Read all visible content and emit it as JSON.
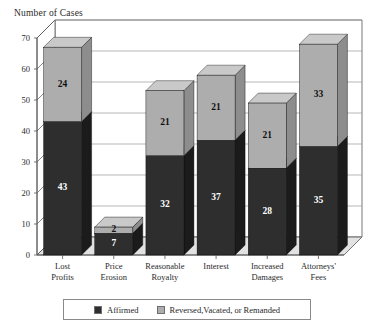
{
  "chart_data": {
    "type": "bar",
    "subtype": "stacked-3d-column",
    "title": "",
    "ylabel": "Number of Cases",
    "xlabel": "",
    "ylim": [
      0,
      70
    ],
    "yticks": [
      0,
      10,
      20,
      30,
      40,
      50,
      60,
      70
    ],
    "grid": true,
    "grid_axis": "y",
    "legend_position": "bottom",
    "categories": [
      "Lost Profits",
      "Price Erosion",
      "Reasonable Royalty",
      "Interest",
      "Increased Damages",
      "Attorneys' Fees"
    ],
    "category_lines": [
      [
        "Lost",
        "Profits"
      ],
      [
        "Price",
        "Erosion"
      ],
      [
        "Reasonable",
        "Royalty"
      ],
      [
        "Interest",
        ""
      ],
      [
        "Increased",
        "Damages"
      ],
      [
        "Attorneys'",
        "Fees"
      ]
    ],
    "series": [
      {
        "name": "Affirmed",
        "color": "#2e2e2e",
        "values": [
          43,
          7,
          32,
          37,
          28,
          35
        ]
      },
      {
        "name": "Reversed, Vacated, or Remanded",
        "color": "#adadad",
        "values": [
          24,
          2,
          21,
          21,
          21,
          33
        ]
      }
    ],
    "totals": [
      67,
      9,
      53,
      58,
      49,
      68
    ]
  },
  "axis": {
    "y_title": "Number of Cases",
    "tick_labels": [
      "70",
      "60",
      "50",
      "40",
      "30",
      "20",
      "10",
      "0"
    ]
  },
  "bar_labels": {
    "affirmed": [
      "43",
      "7",
      "32",
      "37",
      "28",
      "35"
    ],
    "reversed": [
      "24",
      "2",
      "21",
      "21",
      "21",
      "33"
    ]
  },
  "legend": {
    "items": [
      {
        "label": "Affirmed",
        "color": "#2e2e2e"
      },
      {
        "label": "Reversed,Vacated, or Remanded",
        "color": "#adadad"
      }
    ]
  },
  "colors": {
    "affirmed_front": "#2e2e2e",
    "affirmed_top": "#4a4a4a",
    "affirmed_side": "#1b1b1b",
    "reversed_front": "#adadad",
    "reversed_top": "#c9c9c9",
    "reversed_side": "#8d8d8d",
    "floor": "#e2e2e2",
    "wall": "#ffffff",
    "grid": "#9a9a9a",
    "axis": "#555555"
  }
}
